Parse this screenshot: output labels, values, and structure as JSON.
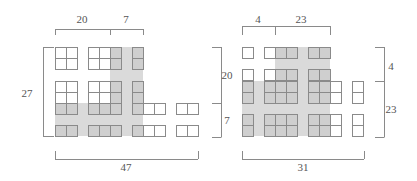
{
  "colors": {
    "background": "#ffffff",
    "shade_region": "#dadada",
    "cell_fill_gray": "#cfcfcf",
    "cell_fill_white": "#ffffff",
    "cell_border": "#8a8a8a",
    "bracket": "#8a8a8a",
    "label": "#555555"
  },
  "cell_size": 11,
  "figures": [
    {
      "id": "left",
      "shade": [
        {
          "x": 110,
          "y": 47,
          "w": 33,
          "h": 89
        },
        {
          "x": 55,
          "y": 103,
          "w": 88,
          "h": 33
        }
      ],
      "cells": [
        {
          "x": 55,
          "y": 47,
          "g": 0
        },
        {
          "x": 66,
          "y": 47,
          "g": 0
        },
        {
          "x": 55,
          "y": 58,
          "g": 0
        },
        {
          "x": 66,
          "y": 58,
          "g": 0
        },
        {
          "x": 88,
          "y": 47,
          "g": 0
        },
        {
          "x": 99,
          "y": 47,
          "g": 0
        },
        {
          "x": 110,
          "y": 47,
          "g": 1
        },
        {
          "x": 88,
          "y": 58,
          "g": 0
        },
        {
          "x": 99,
          "y": 58,
          "g": 0
        },
        {
          "x": 110,
          "y": 58,
          "g": 1
        },
        {
          "x": 132,
          "y": 47,
          "g": 1
        },
        {
          "x": 132,
          "y": 58,
          "g": 1
        },
        {
          "x": 55,
          "y": 81,
          "g": 0
        },
        {
          "x": 66,
          "y": 81,
          "g": 0
        },
        {
          "x": 55,
          "y": 92,
          "g": 0
        },
        {
          "x": 66,
          "y": 92,
          "g": 0
        },
        {
          "x": 55,
          "y": 103,
          "g": 1
        },
        {
          "x": 66,
          "y": 103,
          "g": 1
        },
        {
          "x": 88,
          "y": 81,
          "g": 0
        },
        {
          "x": 99,
          "y": 81,
          "g": 0
        },
        {
          "x": 110,
          "y": 81,
          "g": 1
        },
        {
          "x": 88,
          "y": 92,
          "g": 0
        },
        {
          "x": 99,
          "y": 92,
          "g": 0
        },
        {
          "x": 110,
          "y": 92,
          "g": 1
        },
        {
          "x": 88,
          "y": 103,
          "g": 1
        },
        {
          "x": 99,
          "y": 103,
          "g": 1
        },
        {
          "x": 110,
          "y": 103,
          "g": 1
        },
        {
          "x": 132,
          "y": 81,
          "g": 1
        },
        {
          "x": 132,
          "y": 92,
          "g": 1
        },
        {
          "x": 132,
          "y": 103,
          "g": 1
        },
        {
          "x": 143,
          "y": 103,
          "g": 0
        },
        {
          "x": 154,
          "y": 103,
          "g": 0
        },
        {
          "x": 176,
          "y": 103,
          "g": 0
        },
        {
          "x": 187,
          "y": 103,
          "g": 0
        },
        {
          "x": 55,
          "y": 125,
          "g": 1
        },
        {
          "x": 66,
          "y": 125,
          "g": 1
        },
        {
          "x": 88,
          "y": 125,
          "g": 1
        },
        {
          "x": 99,
          "y": 125,
          "g": 1
        },
        {
          "x": 110,
          "y": 125,
          "g": 1
        },
        {
          "x": 132,
          "y": 125,
          "g": 1
        },
        {
          "x": 143,
          "y": 125,
          "g": 0
        },
        {
          "x": 154,
          "y": 125,
          "g": 0
        },
        {
          "x": 176,
          "y": 125,
          "g": 0
        },
        {
          "x": 187,
          "y": 125,
          "g": 0
        }
      ],
      "brackets": {
        "top": {
          "y": 29,
          "drop": 6,
          "x": [
            55,
            110,
            143
          ],
          "labels": [
            "20",
            "7"
          ]
        },
        "left": {
          "x": 44,
          "tick": 10,
          "y0": 47,
          "y1": 137,
          "label": "27"
        },
        "right": {
          "x": 221,
          "tick": 9,
          "y": [
            47,
            103,
            137
          ],
          "labels": [
            "20",
            "7"
          ]
        },
        "bottom": {
          "y": 159,
          "rise": 8,
          "x0": 55,
          "x1": 198,
          "label": "47"
        }
      }
    },
    {
      "id": "right",
      "shade": [
        {
          "x": 275,
          "y": 47,
          "w": 55,
          "h": 89
        },
        {
          "x": 242,
          "y": 81,
          "w": 88,
          "h": 55
        }
      ],
      "cells": [
        {
          "x": 242,
          "y": 47,
          "g": 0
        },
        {
          "x": 264,
          "y": 47,
          "g": 0
        },
        {
          "x": 275,
          "y": 47,
          "g": 1
        },
        {
          "x": 286,
          "y": 47,
          "g": 1
        },
        {
          "x": 308,
          "y": 47,
          "g": 1
        },
        {
          "x": 319,
          "y": 47,
          "g": 1
        },
        {
          "x": 242,
          "y": 69,
          "g": 0
        },
        {
          "x": 242,
          "y": 81,
          "g": 1
        },
        {
          "x": 242,
          "y": 92,
          "g": 1
        },
        {
          "x": 264,
          "y": 69,
          "g": 0
        },
        {
          "x": 264,
          "y": 81,
          "g": 1
        },
        {
          "x": 264,
          "y": 92,
          "g": 1
        },
        {
          "x": 275,
          "y": 69,
          "g": 1
        },
        {
          "x": 275,
          "y": 81,
          "g": 1
        },
        {
          "x": 275,
          "y": 92,
          "g": 1
        },
        {
          "x": 286,
          "y": 69,
          "g": 1
        },
        {
          "x": 286,
          "y": 81,
          "g": 1
        },
        {
          "x": 286,
          "y": 92,
          "g": 1
        },
        {
          "x": 308,
          "y": 69,
          "g": 1
        },
        {
          "x": 308,
          "y": 81,
          "g": 1
        },
        {
          "x": 308,
          "y": 92,
          "g": 1
        },
        {
          "x": 319,
          "y": 69,
          "g": 1
        },
        {
          "x": 319,
          "y": 81,
          "g": 1
        },
        {
          "x": 319,
          "y": 92,
          "g": 1
        },
        {
          "x": 330,
          "y": 81,
          "g": 0
        },
        {
          "x": 330,
          "y": 92,
          "g": 0
        },
        {
          "x": 352,
          "y": 81,
          "g": 0
        },
        {
          "x": 352,
          "y": 92,
          "g": 0
        },
        {
          "x": 242,
          "y": 114,
          "g": 1
        },
        {
          "x": 242,
          "y": 125,
          "g": 1
        },
        {
          "x": 264,
          "y": 114,
          "g": 1
        },
        {
          "x": 275,
          "y": 114,
          "g": 1
        },
        {
          "x": 286,
          "y": 114,
          "g": 1
        },
        {
          "x": 264,
          "y": 125,
          "g": 1
        },
        {
          "x": 275,
          "y": 125,
          "g": 1
        },
        {
          "x": 286,
          "y": 125,
          "g": 1
        },
        {
          "x": 308,
          "y": 114,
          "g": 1
        },
        {
          "x": 319,
          "y": 114,
          "g": 1
        },
        {
          "x": 330,
          "y": 114,
          "g": 0
        },
        {
          "x": 308,
          "y": 125,
          "g": 1
        },
        {
          "x": 319,
          "y": 125,
          "g": 1
        },
        {
          "x": 330,
          "y": 125,
          "g": 0
        },
        {
          "x": 352,
          "y": 114,
          "g": 0
        },
        {
          "x": 352,
          "y": 125,
          "g": 0
        }
      ],
      "brackets": {
        "top": {
          "y": 26,
          "drop": 9,
          "x": [
            242,
            275,
            330
          ],
          "labels": [
            "4",
            "23"
          ]
        },
        "left": {
          "x": 220,
          "tick": 9,
          "y": [
            47,
            103,
            137
          ],
          "labels": [
            "20",
            "7"
          ],
          "hidden": true
        },
        "right": {
          "x": 384,
          "tick": 9,
          "y": [
            47,
            81,
            137
          ],
          "labels": [
            "4",
            "23"
          ]
        },
        "bottom": {
          "y": 159,
          "rise": 8,
          "x0": 242,
          "x1": 364,
          "label": "31"
        }
      }
    }
  ],
  "labels": [
    {
      "id": "left-top-20",
      "text": "20",
      "x": 82,
      "y": 19
    },
    {
      "id": "left-top-7",
      "text": "7",
      "x": 126,
      "y": 19
    },
    {
      "id": "left-side-27",
      "text": "27",
      "x": 27,
      "y": 93
    },
    {
      "id": "left-right-20",
      "text": "20",
      "x": 227,
      "y": 75
    },
    {
      "id": "left-right-7",
      "text": "7",
      "x": 227,
      "y": 120
    },
    {
      "id": "left-bottom-47",
      "text": "47",
      "x": 126,
      "y": 167
    },
    {
      "id": "right-top-4",
      "text": "4",
      "x": 258,
      "y": 19
    },
    {
      "id": "right-top-23",
      "text": "23",
      "x": 301,
      "y": 19
    },
    {
      "id": "right-right-4",
      "text": "4",
      "x": 391,
      "y": 66
    },
    {
      "id": "right-right-23",
      "text": "23",
      "x": 391,
      "y": 109
    },
    {
      "id": "right-bottom-31",
      "text": "31",
      "x": 303,
      "y": 167
    }
  ]
}
